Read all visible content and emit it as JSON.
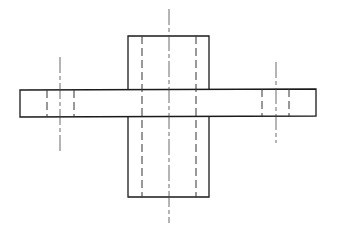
{
  "drawing": {
    "type": "orthographic technical drawing",
    "colors": {
      "line": "#1a1a1a",
      "background": "#ffffff"
    },
    "vertical_block": {
      "x": 128,
      "y": 36,
      "width": 81,
      "height": 161,
      "hidden_bore_x": [
        142,
        196
      ]
    },
    "horizontal_plate": {
      "x1": 20,
      "x2": 316,
      "y_top_left": 90,
      "y_bottom_left": 117,
      "y_top_right": 89,
      "y_bottom_right": 116
    },
    "center_axis": {
      "x": 169,
      "y1": 9,
      "y2": 223
    },
    "left_hole": {
      "center_x": 60,
      "hidden_x": [
        47,
        74
      ],
      "axis_y": [
        57,
        152
      ]
    },
    "right_hole": {
      "center_x": 276,
      "hidden_x": [
        262,
        289
      ],
      "axis_y": [
        62,
        143
      ]
    }
  }
}
